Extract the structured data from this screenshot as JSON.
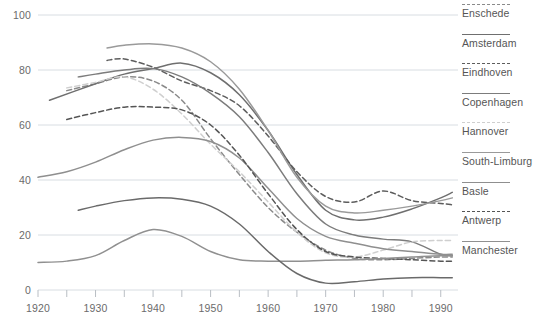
{
  "chart_data": {
    "type": "line",
    "title": "",
    "subtitle": "",
    "xlabel": "",
    "ylabel": "",
    "xlim": [
      1920,
      1993
    ],
    "ylim": [
      0,
      100
    ],
    "grid": "horizontal",
    "legend_position": "right",
    "x_ticks": [
      1920,
      1930,
      1940,
      1950,
      1960,
      1970,
      1980,
      1990
    ],
    "x_minor_ticks": [
      1925,
      1935,
      1945,
      1955,
      1965,
      1975,
      1985
    ],
    "y_ticks": [
      0,
      20,
      40,
      60,
      80,
      100
    ],
    "series": [
      {
        "name": "Enschede",
        "style": "dashed",
        "color": "#8a8a8a",
        "x": [
          1925,
          1930,
          1935,
          1940,
          1945,
          1950,
          1955,
          1960,
          1965,
          1970,
          1975,
          1980,
          1985,
          1990,
          1992
        ],
        "values": [
          72.5,
          75.0,
          77.5,
          76.0,
          69.0,
          55.0,
          42.0,
          30.0,
          21.0,
          14.5,
          11.5,
          11.0,
          11.5,
          12.0,
          12.0
        ]
      },
      {
        "name": "Amsterdam",
        "style": "solid",
        "color": "#6f6f6f",
        "x": [
          1922,
          1930,
          1935,
          1940,
          1945,
          1950,
          1955,
          1960,
          1965,
          1970,
          1975,
          1980,
          1985,
          1990,
          1992
        ],
        "values": [
          69.0,
          75.0,
          78.5,
          80.5,
          82.5,
          79.0,
          71.0,
          58.0,
          42.0,
          29.0,
          25.5,
          26.5,
          29.5,
          33.5,
          35.5
        ]
      },
      {
        "name": "Eindhoven",
        "style": "dashed",
        "color": "#5d5d5d",
        "x": [
          1932,
          1935,
          1940,
          1945,
          1950,
          1955,
          1960,
          1965,
          1970,
          1975,
          1980,
          1985,
          1990,
          1992
        ],
        "values": [
          83.5,
          84.0,
          81.0,
          76.0,
          72.5,
          67.0,
          56.0,
          43.0,
          34.0,
          32.0,
          36.0,
          32.5,
          31.5,
          31.0
        ]
      },
      {
        "name": "Copenhagen",
        "style": "solid",
        "color": "#7c7c7c",
        "x": [
          1927,
          1930,
          1935,
          1940,
          1945,
          1950,
          1955,
          1960,
          1965,
          1970,
          1975,
          1980,
          1985,
          1990,
          1992
        ],
        "values": [
          77.5,
          78.5,
          80.0,
          80.5,
          77.5,
          71.5,
          63.0,
          50.0,
          35.0,
          24.0,
          20.0,
          18.5,
          17.5,
          13.0,
          12.5
        ]
      },
      {
        "name": "Hannover",
        "style": "dashed",
        "color": "#cfcfcf",
        "x": [
          1925,
          1930,
          1935,
          1940,
          1945,
          1950,
          1955,
          1960,
          1965,
          1970,
          1975,
          1980,
          1985,
          1990,
          1992
        ],
        "values": [
          73.5,
          75.5,
          77.5,
          73.0,
          64.0,
          53.0,
          43.0,
          32.0,
          21.0,
          13.5,
          12.0,
          14.5,
          17.5,
          18.0,
          18.0
        ]
      },
      {
        "name": "South-Limburg",
        "style": "solid",
        "color": "#9a9a9a",
        "x": [
          1932,
          1935,
          1940,
          1945,
          1950,
          1955,
          1960,
          1965,
          1970,
          1975,
          1980,
          1985,
          1990,
          1992
        ],
        "values": [
          88.0,
          89.0,
          89.5,
          88.0,
          83.0,
          73.0,
          58.0,
          41.0,
          30.5,
          28.0,
          29.0,
          30.5,
          32.5,
          33.5
        ]
      },
      {
        "name": "Basle",
        "style": "solid",
        "color": "#8f8f8f",
        "x": [
          1920,
          1925,
          1930,
          1935,
          1940,
          1945,
          1950,
          1955,
          1960,
          1965,
          1970,
          1975,
          1980,
          1985,
          1990,
          1992
        ],
        "values": [
          41.0,
          43.0,
          46.5,
          51.0,
          54.5,
          55.5,
          54.0,
          48.0,
          37.0,
          26.0,
          19.5,
          17.0,
          15.0,
          14.0,
          13.0,
          13.0
        ]
      },
      {
        "name": "Antwerp",
        "style": "dashed",
        "color": "#555555",
        "x": [
          1925,
          1930,
          1935,
          1940,
          1945,
          1950,
          1955,
          1960,
          1965,
          1970,
          1975,
          1980,
          1985,
          1990,
          1992
        ],
        "values": [
          62.0,
          64.5,
          66.5,
          66.5,
          65.5,
          60.0,
          49.0,
          35.0,
          22.0,
          14.0,
          12.0,
          11.5,
          11.0,
          10.5,
          10.5
        ]
      },
      {
        "name": "Manchester",
        "style": "solid",
        "color": "#909090",
        "x": [
          1920,
          1925,
          1930,
          1935,
          1940,
          1945,
          1950,
          1955,
          1960,
          1965,
          1970,
          1975,
          1980,
          1985,
          1990,
          1992
        ],
        "values": [
          10.0,
          10.5,
          12.5,
          18.0,
          22.0,
          19.5,
          14.0,
          11.0,
          10.5,
          10.5,
          10.8,
          11.0,
          11.5,
          12.0,
          12.5,
          12.5
        ]
      },
      {
        "name": "Antwerp-solid",
        "style": "solid",
        "color": "#6a6a6a",
        "x": [
          1927,
          1930,
          1935,
          1940,
          1945,
          1950,
          1955,
          1960,
          1965,
          1970,
          1975,
          1980,
          1985,
          1990,
          1992
        ],
        "values": [
          29.0,
          30.5,
          32.5,
          33.5,
          33.0,
          30.5,
          24.0,
          14.0,
          6.0,
          2.5,
          3.0,
          4.0,
          4.5,
          4.5,
          4.5
        ]
      }
    ]
  },
  "legend": {
    "items": [
      {
        "label": "Enschede",
        "style": "dashed",
        "color": "#8a8a8a"
      },
      {
        "label": "Amsterdam",
        "style": "solid",
        "color": "#6f6f6f"
      },
      {
        "label": "Eindhoven",
        "style": "dashed",
        "color": "#5d5d5d"
      },
      {
        "label": "Copenhagen",
        "style": "solid",
        "color": "#7c7c7c"
      },
      {
        "label": "Hannover",
        "style": "dashed",
        "color": "#cfcfcf"
      },
      {
        "label": "South-Limburg",
        "style": "solid",
        "color": "#9a9a9a"
      },
      {
        "label": "Basle",
        "style": "solid",
        "color": "#8f8f8f"
      },
      {
        "label": "Antwerp",
        "style": "dashed",
        "color": "#555555"
      },
      {
        "label": "Manchester",
        "style": "solid",
        "color": "#909090"
      }
    ]
  },
  "axes": {
    "y_tick_labels": [
      "0",
      "20",
      "40",
      "60",
      "80",
      "100"
    ],
    "x_tick_labels": [
      "1920",
      "1930",
      "1940",
      "1950",
      "1960",
      "1970",
      "1980",
      "1990"
    ]
  },
  "colors": {
    "gridline": "#d8dde2",
    "axis": "#b9bec4",
    "text": "#5a5a5a"
  }
}
